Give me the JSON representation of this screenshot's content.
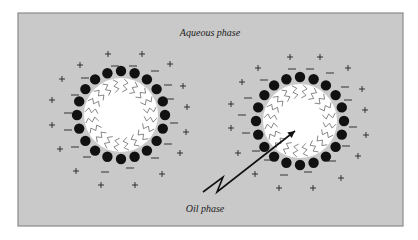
{
  "frame": {
    "x": 18,
    "y": 13,
    "w": 385,
    "h": 213,
    "fill": "#c9c9c9",
    "stroke": "#8a8a8a"
  },
  "labels": {
    "aqueous": {
      "text": "Aqueous phase",
      "x": 210,
      "y": 36
    },
    "oil": {
      "text": "Oil phase",
      "x": 205,
      "y": 212
    }
  },
  "droplets": [
    {
      "name": "left-droplet",
      "cx": 121,
      "cy": 115,
      "r": 37,
      "head_r": 5.2,
      "head_orbit": 44,
      "heads": 20,
      "tail_count": 20
    },
    {
      "name": "right-droplet",
      "cx": 300,
      "cy": 121,
      "r": 37,
      "head_r": 5.2,
      "head_orbit": 44,
      "heads": 20,
      "tail_count": 20
    }
  ],
  "arrow": {
    "points": [
      [
        203,
        192
      ],
      [
        223,
        177
      ],
      [
        217,
        192
      ],
      [
        295,
        131
      ]
    ],
    "color": "#111"
  },
  "colors": {
    "oil_core": "#ffffff",
    "head": "#111111",
    "tail": "#555555"
  },
  "charges": {
    "plus": [
      [
        108,
        54
      ],
      [
        142,
        54
      ],
      [
        80,
        65
      ],
      [
        170,
        64
      ],
      [
        62,
        79
      ],
      [
        183,
        86
      ],
      [
        52,
        100
      ],
      [
        187,
        107
      ],
      [
        52,
        125
      ],
      [
        186,
        132
      ],
      [
        60,
        149
      ],
      [
        180,
        153
      ],
      [
        76,
        171
      ],
      [
        162,
        174
      ],
      [
        101,
        185
      ],
      [
        135,
        185
      ],
      [
        290,
        57
      ],
      [
        320,
        57
      ],
      [
        258,
        68
      ],
      [
        348,
        68
      ],
      [
        242,
        82
      ],
      [
        362,
        89
      ],
      [
        231,
        104
      ],
      [
        365,
        110
      ],
      [
        231,
        128
      ],
      [
        366,
        135
      ],
      [
        238,
        153
      ],
      [
        358,
        156
      ],
      [
        255,
        174
      ],
      [
        341,
        178
      ],
      [
        279,
        188
      ],
      [
        313,
        188
      ]
    ],
    "minus": [
      [
        115,
        66
      ],
      [
        133,
        66
      ],
      [
        85,
        78
      ],
      [
        155,
        71
      ],
      [
        75,
        95
      ],
      [
        168,
        85
      ],
      [
        68,
        113
      ],
      [
        170,
        99
      ],
      [
        68,
        130
      ],
      [
        174,
        123
      ],
      [
        75,
        147
      ],
      [
        168,
        144
      ],
      [
        87,
        157
      ],
      [
        155,
        158
      ],
      [
        105,
        172
      ],
      [
        130,
        168
      ],
      [
        292,
        69
      ],
      [
        310,
        69
      ],
      [
        264,
        80
      ],
      [
        330,
        73
      ],
      [
        248,
        98
      ],
      [
        345,
        87
      ],
      [
        242,
        115
      ],
      [
        348,
        100
      ],
      [
        246,
        133
      ],
      [
        353,
        127
      ],
      [
        256,
        151
      ],
      [
        346,
        146
      ],
      [
        268,
        160
      ],
      [
        332,
        161
      ],
      [
        284,
        175
      ],
      [
        308,
        172
      ]
    ]
  }
}
